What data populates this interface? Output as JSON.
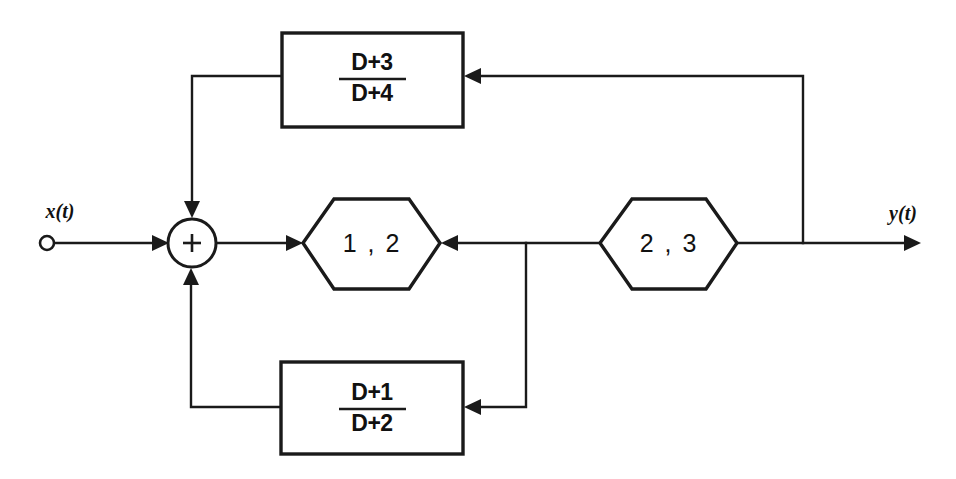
{
  "diagram": {
    "line_color": "#1a1a1a",
    "background_color": "#ffffff",
    "input": {
      "label": "x(t)",
      "terminal": "open-circle"
    },
    "output": {
      "label": "y(t)",
      "terminal": "arrow"
    },
    "summer": {
      "symbol": "+",
      "inputs": 3
    },
    "hexagons": [
      {
        "id": "hex-left",
        "label": "1 , 2"
      },
      {
        "id": "hex-right",
        "label": "2 , 3"
      }
    ],
    "blocks": [
      {
        "id": "block-top",
        "numerator": "D+3",
        "denominator": "D+4",
        "position": "upper-feedback"
      },
      {
        "id": "block-bottom",
        "numerator": "D+1",
        "denominator": "D+2",
        "position": "lower-feedback"
      }
    ]
  }
}
